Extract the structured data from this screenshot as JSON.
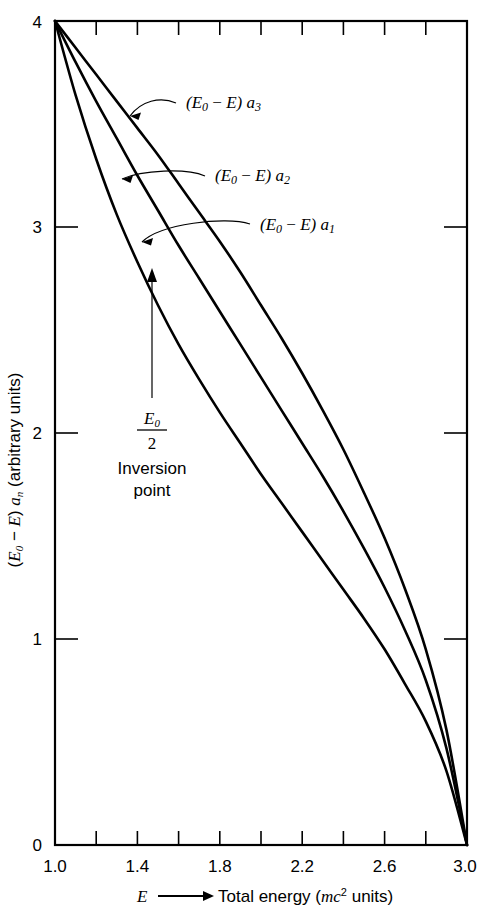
{
  "chart_data": {
    "type": "line",
    "title": "",
    "subtitle": "",
    "xlabel": "E ⟶ Total energy (mc² units)",
    "ylabel": "(E₀ − E) aₙ (arbitrary units)",
    "xlim": [
      1.0,
      3.0
    ],
    "ylim": [
      0,
      4
    ],
    "xticks": [
      1.0,
      1.2,
      1.4,
      1.6,
      1.8,
      2.0,
      2.2,
      2.4,
      2.6,
      2.8,
      3.0
    ],
    "xtick_labels": [
      "1.0",
      "",
      "1.4",
      "",
      "1.8",
      "",
      "2.2",
      "",
      "2.6",
      "",
      "3.0"
    ],
    "yticks": [
      0,
      1,
      2,
      3,
      4
    ],
    "ytick_labels": [
      "0",
      "1",
      "2",
      "3",
      "4"
    ],
    "grid": false,
    "legend_position": "inline-annotations",
    "x": [
      1.0,
      1.1,
      1.2,
      1.3,
      1.4,
      1.5,
      1.6,
      1.7,
      1.8,
      1.9,
      2.0,
      2.1,
      2.2,
      2.3,
      2.4,
      2.5,
      2.6,
      2.7,
      2.8,
      2.9,
      3.0
    ],
    "series": [
      {
        "name": "(E₀ − E) a₁",
        "label": "(E₀ − E) a₁",
        "values": [
          4.0,
          3.64,
          3.33,
          3.06,
          2.83,
          2.62,
          2.43,
          2.26,
          2.1,
          1.95,
          1.8,
          1.66,
          1.52,
          1.38,
          1.24,
          1.1,
          0.95,
          0.78,
          0.6,
          0.36,
          0.0
        ]
      },
      {
        "name": "(E₀ − E) a₂",
        "label": "(E₀ − E) a₂",
        "values": [
          4.0,
          3.8,
          3.61,
          3.43,
          3.25,
          3.08,
          2.91,
          2.75,
          2.59,
          2.43,
          2.27,
          2.11,
          1.95,
          1.79,
          1.62,
          1.44,
          1.25,
          1.04,
          0.8,
          0.47,
          0.0
        ]
      },
      {
        "name": "(E₀ − E) a₃",
        "label": "(E₀ − E) a₃",
        "values": [
          4.0,
          3.87,
          3.74,
          3.61,
          3.48,
          3.35,
          3.21,
          3.07,
          2.93,
          2.78,
          2.62,
          2.46,
          2.29,
          2.11,
          1.92,
          1.71,
          1.49,
          1.24,
          0.95,
          0.56,
          0.0
        ]
      }
    ],
    "annotations": [
      {
        "name": "inversion-point",
        "line1": "E₀",
        "line2": "2",
        "line3": "Inversion",
        "line4": "point",
        "points_to_series": "(E₀ − E) a₁",
        "points_to_x": 1.45
      }
    ]
  },
  "axes": {
    "x": {
      "label_symbol": "E",
      "label_arrow": "⟶",
      "label_text": "Total energy (",
      "label_units_base": "mc",
      "label_units_exp": "2",
      "label_units_tail": " units)",
      "ticks": [
        {
          "value": "1.0",
          "pos": 1.0
        },
        {
          "value": "",
          "pos": 1.2
        },
        {
          "value": "1.4",
          "pos": 1.4
        },
        {
          "value": "",
          "pos": 1.6
        },
        {
          "value": "1.8",
          "pos": 1.8
        },
        {
          "value": "",
          "pos": 2.0
        },
        {
          "value": "2.2",
          "pos": 2.2
        },
        {
          "value": "",
          "pos": 2.4
        },
        {
          "value": "2.6",
          "pos": 2.6
        },
        {
          "value": "",
          "pos": 2.8
        },
        {
          "value": "3.0",
          "pos": 3.0
        }
      ]
    },
    "y": {
      "label_open": "(",
      "label_e0": "E",
      "label_e0_sub": "0",
      "label_minus": " − ",
      "label_e": "E",
      "label_close": ") ",
      "label_a": "a",
      "label_a_sub": "n",
      "label_units": " (arbitrary units)",
      "ticks": [
        {
          "value": "0",
          "pos": 0
        },
        {
          "value": "1",
          "pos": 1
        },
        {
          "value": "2",
          "pos": 2
        },
        {
          "value": "3",
          "pos": 3
        },
        {
          "value": "4",
          "pos": 4
        }
      ]
    }
  },
  "curve_labels": {
    "a3": {
      "open": "(",
      "e0": "E",
      "e0sub": "0",
      "minus": " − ",
      "e": "E",
      "close": ") ",
      "a": "a",
      "asub": "3"
    },
    "a2": {
      "open": "(",
      "e0": "E",
      "e0sub": "0",
      "minus": " − ",
      "e": "E",
      "close": ") ",
      "a": "a",
      "asub": "2"
    },
    "a1": {
      "open": "(",
      "e0": "E",
      "e0sub": "0",
      "minus": " − ",
      "e": "E",
      "close": ") ",
      "a": "a",
      "asub": "1"
    }
  },
  "inversion": {
    "numerator": "E",
    "numerator_sub": "0",
    "denominator": "2",
    "line_a": "Inversion",
    "line_b": "point"
  },
  "colors": {
    "ink": "#000000",
    "paper": "#ffffff"
  }
}
